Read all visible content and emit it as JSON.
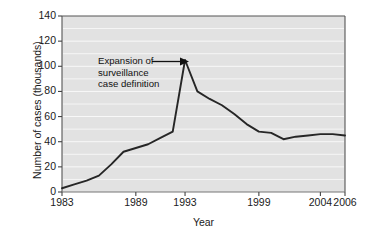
{
  "chart_data": {
    "type": "line",
    "title": "",
    "xlabel": "Year",
    "ylabel": "Number of cases (thousands)",
    "xlim": [
      1983,
      2006
    ],
    "ylim": [
      0,
      140
    ],
    "ytick_labels": [
      "0",
      "20",
      "40",
      "60",
      "80",
      "100",
      "120",
      "140"
    ],
    "ytick_values": [
      0,
      20,
      40,
      60,
      80,
      100,
      120,
      140
    ],
    "xtick_labels": [
      "1983",
      "1989",
      "1993",
      "1999",
      "2004",
      "2006"
    ],
    "xtick_values": [
      1983,
      1989,
      1993,
      1999,
      2004,
      2006
    ],
    "grid": "horizontal-minor-white-every-10",
    "legend": "none",
    "line_color": "#262626",
    "plot_bg_color": "#e2e2e2",
    "figure_bg_color": "#ffffff",
    "series": [
      {
        "name": "AIDS cases",
        "x": [
          1983,
          1984,
          1985,
          1986,
          1987,
          1988,
          1989,
          1990,
          1991,
          1992,
          1993,
          1994,
          1995,
          1996,
          1997,
          1998,
          1999,
          2000,
          2001,
          2002,
          2003,
          2004,
          2005,
          2006
        ],
        "values": [
          3,
          6,
          9,
          13,
          22,
          32,
          35,
          38,
          43,
          48,
          105,
          80,
          74,
          69,
          62,
          54,
          48,
          47,
          42,
          44,
          45,
          46,
          46,
          45
        ]
      }
    ],
    "annotations": [
      {
        "name": "expansion-annotation",
        "lines": [
          "Expansion of",
          "surveillance",
          "case definition"
        ],
        "text": "Expansion of surveillance case definition",
        "points_to_x": 1993,
        "points_to_y": 105,
        "arrow": true
      }
    ]
  }
}
